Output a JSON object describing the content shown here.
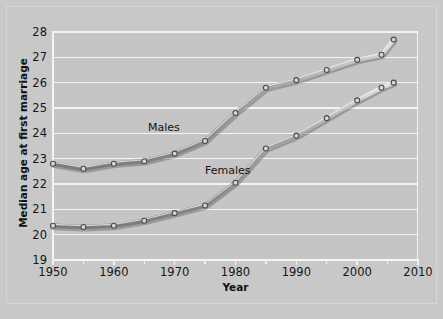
{
  "chart_data": {
    "type": "line",
    "title": "",
    "xlabel": "Year",
    "ylabel": "Median age at first marriage",
    "xlim": [
      1950,
      2010
    ],
    "ylim": [
      19,
      28
    ],
    "grid": true,
    "legend_position": "inline-annotation",
    "x_ticks": [
      1950,
      1960,
      1970,
      1980,
      1990,
      2000,
      2010
    ],
    "x_tick_labels": [
      "1950",
      "1960",
      "1970",
      "1980",
      "1990",
      "2000",
      "2010"
    ],
    "x_minor_ticks": [
      1955,
      1965,
      1975,
      1985,
      1995,
      2005
    ],
    "y_ticks": [
      19,
      20,
      21,
      22,
      23,
      24,
      25,
      26,
      27,
      28
    ],
    "y_tick_labels": [
      "19",
      "20",
      "21",
      "22",
      "23",
      "24",
      "25",
      "26",
      "27",
      "28"
    ],
    "series": [
      {
        "name": "Males",
        "x": [
          1950,
          1955,
          1960,
          1965,
          1970,
          1975,
          1980,
          1985,
          1990,
          1995,
          2000,
          2004,
          2006
        ],
        "values": [
          22.8,
          22.6,
          22.8,
          22.9,
          23.2,
          23.7,
          24.8,
          25.8,
          26.1,
          26.5,
          26.9,
          27.1,
          27.7
        ]
      },
      {
        "name": "Females",
        "x": [
          1950,
          1955,
          1960,
          1965,
          1970,
          1975,
          1980,
          1985,
          1990,
          1995,
          2000,
          2004,
          2006
        ],
        "values": [
          20.35,
          20.3,
          20.35,
          20.55,
          20.85,
          21.15,
          22.05,
          23.4,
          23.9,
          24.6,
          25.3,
          25.8,
          26.0
        ]
      }
    ],
    "annotations": [
      {
        "text": "Males",
        "x": 1972,
        "y": 24.15
      },
      {
        "text": "Females",
        "x": 1982,
        "y": 22.4
      }
    ],
    "colors": {
      "background": "#c9c9c9",
      "plot_background": "#c5c5c5",
      "gridline": "#f4f4f4",
      "line": "#8a8a8a",
      "line_highlight": "#d8d8d8",
      "marker_face": "#d5d5d5",
      "marker_edge": "#4a4a4a",
      "text": "#161616"
    }
  }
}
